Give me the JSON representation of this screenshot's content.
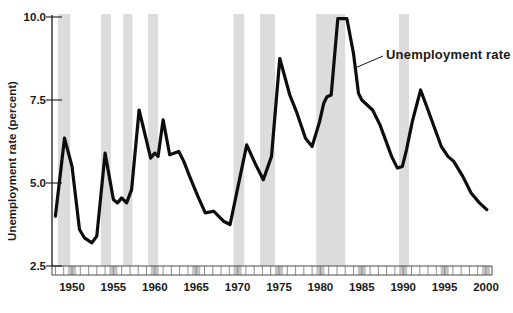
{
  "chart_data": {
    "type": "line",
    "title": "",
    "xlabel": "",
    "ylabel": "Unemployment rate (percent)",
    "annotation": "Unemployment rate",
    "legend_position": "annotation pointing to curve near 1984 peak descent",
    "grid": false,
    "xlim": [
      1947.6,
      2000.7
    ],
    "ylim": [
      2.5,
      10.0
    ],
    "x_label_years": [
      1950,
      1955,
      1960,
      1965,
      1970,
      1975,
      1980,
      1985,
      1990,
      1995,
      2000
    ],
    "x_label_texts": [
      "1950",
      "1955",
      "1960",
      "1965",
      "1970",
      "1975",
      "1980",
      "1985",
      "1990",
      "1995",
      "2000"
    ],
    "x_minor_tick_step_years": 1,
    "y_ticks": [
      2.5,
      5.0,
      7.5,
      10.0
    ],
    "y_tick_labels": [
      "2.5",
      "5.0",
      "7.5",
      "10.0"
    ],
    "line_color": "#0d0d0d",
    "band_color": "#dcdcdc",
    "axis_color": "#1a1a1a",
    "strip_cell_color": "#c3c3c3",
    "recession_bands_years": [
      [
        1948.3,
        1949.8
      ],
      [
        1953.5,
        1954.7
      ],
      [
        1956.2,
        1957.3
      ],
      [
        1959.2,
        1960.4
      ],
      [
        1969.5,
        1970.8
      ],
      [
        1972.7,
        1974.5
      ],
      [
        1979.5,
        1983.0
      ],
      [
        1989.5,
        1990.7
      ]
    ],
    "series": [
      {
        "name": "Unemployment rate",
        "units": "percent",
        "points": [
          [
            1948.0,
            4.0
          ],
          [
            1949.1,
            6.35
          ],
          [
            1950.0,
            5.5
          ],
          [
            1950.9,
            3.6
          ],
          [
            1951.5,
            3.35
          ],
          [
            1952.4,
            3.2
          ],
          [
            1953.0,
            3.4
          ],
          [
            1954.0,
            5.9
          ],
          [
            1955.0,
            4.5
          ],
          [
            1955.5,
            4.4
          ],
          [
            1956.0,
            4.55
          ],
          [
            1956.6,
            4.4
          ],
          [
            1957.2,
            4.8
          ],
          [
            1958.1,
            7.2
          ],
          [
            1959.5,
            5.75
          ],
          [
            1960.0,
            5.9
          ],
          [
            1960.4,
            5.8
          ],
          [
            1961.0,
            6.9
          ],
          [
            1961.8,
            5.85
          ],
          [
            1962.9,
            5.95
          ],
          [
            1963.5,
            5.65
          ],
          [
            1964.2,
            5.2
          ],
          [
            1965.2,
            4.6
          ],
          [
            1966.1,
            4.1
          ],
          [
            1967.1,
            4.15
          ],
          [
            1968.3,
            3.85
          ],
          [
            1969.1,
            3.75
          ],
          [
            1971.1,
            6.15
          ],
          [
            1972.1,
            5.6
          ],
          [
            1973.1,
            5.1
          ],
          [
            1974.1,
            5.8
          ],
          [
            1975.1,
            8.75
          ],
          [
            1976.3,
            7.65
          ],
          [
            1977.1,
            7.15
          ],
          [
            1978.2,
            6.35
          ],
          [
            1979.0,
            6.1
          ],
          [
            1979.9,
            6.85
          ],
          [
            1980.4,
            7.4
          ],
          [
            1980.8,
            7.6
          ],
          [
            1981.3,
            7.65
          ],
          [
            1982.1,
            9.95
          ],
          [
            1983.2,
            9.95
          ],
          [
            1984.0,
            8.9
          ],
          [
            1984.6,
            7.7
          ],
          [
            1985.0,
            7.5
          ],
          [
            1986.3,
            7.2
          ],
          [
            1987.2,
            6.75
          ],
          [
            1988.6,
            5.8
          ],
          [
            1989.3,
            5.45
          ],
          [
            1989.9,
            5.5
          ],
          [
            1990.4,
            6.0
          ],
          [
            1991.1,
            6.85
          ],
          [
            1992.1,
            7.8
          ],
          [
            1993.0,
            7.2
          ],
          [
            1994.6,
            6.1
          ],
          [
            1995.4,
            5.8
          ],
          [
            1996.1,
            5.65
          ],
          [
            1997.2,
            5.2
          ],
          [
            1998.2,
            4.7
          ],
          [
            1999.2,
            4.4
          ],
          [
            2000.1,
            4.2
          ]
        ]
      }
    ]
  }
}
